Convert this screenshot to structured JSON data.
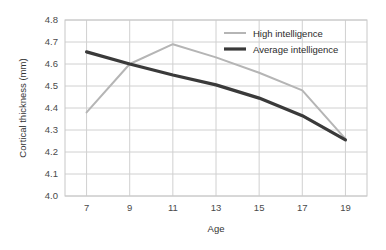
{
  "chart_data": {
    "type": "line",
    "title": "",
    "xlabel": "Age",
    "ylabel": "Cortical thickness (mm)",
    "x": [
      7,
      9,
      11,
      13,
      15,
      17,
      19
    ],
    "xtick_labels": [
      "7",
      "9",
      "11",
      "13",
      "15",
      "17",
      "19"
    ],
    "xlim": [
      6,
      20
    ],
    "ylim": [
      4.0,
      4.8
    ],
    "ytick_labels": [
      "4.0",
      "4.1",
      "4.2",
      "4.3",
      "4.4",
      "4.5",
      "4.6",
      "4.7",
      "4.8"
    ],
    "yticks": [
      4.0,
      4.1,
      4.2,
      4.3,
      4.4,
      4.5,
      4.6,
      4.7,
      4.8
    ],
    "grid": true,
    "legend_position": "top-right",
    "series": [
      {
        "name": "High intelligence",
        "color": "#b5b5b5",
        "line_width": 2.0,
        "values": [
          4.38,
          4.6,
          4.69,
          4.63,
          4.56,
          4.48,
          4.26
        ]
      },
      {
        "name": "Average intelligence",
        "color": "#3a3a3a",
        "line_width": 3.2,
        "values": [
          4.655,
          4.6,
          4.55,
          4.505,
          4.445,
          4.365,
          4.255
        ]
      }
    ]
  },
  "axes": {
    "y_title": "Cortical thickness (mm)",
    "x_title": "Age"
  },
  "legend": {
    "items": [
      {
        "label": "High intelligence",
        "color": "#b5b5b5"
      },
      {
        "label": "Average intelligence",
        "color": "#3a3a3a"
      }
    ]
  },
  "colors": {
    "grid": "#d0d0d0",
    "frame": "#c8c8c8",
    "background": "#ffffff",
    "text": "#333333"
  }
}
